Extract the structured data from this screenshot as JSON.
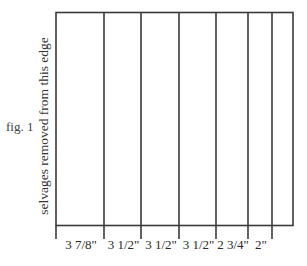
{
  "figure": {
    "label": "fig. 1",
    "side_label": "selvages removed from this edge",
    "strip_widths": [
      "3 7/8\"",
      "3 1/2\"",
      "3 1/2\"",
      "3 1/2\"",
      "2 3/4\"",
      "2\""
    ],
    "strip_widths_in": [
      3.875,
      3.5,
      3.5,
      3.5,
      2.75,
      2.0
    ],
    "remaining_width_note": "",
    "line_color": "#3a3a3a",
    "text_color": "#2a2a2a"
  }
}
